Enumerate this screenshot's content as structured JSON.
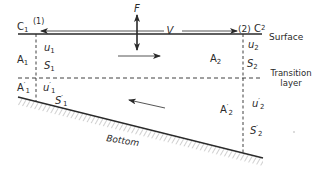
{
  "diagram": {
    "colors": {
      "ink": "#2a2a2a",
      "hatch": "#8a8a8a",
      "background": "#ffffff"
    },
    "surface": {
      "label": "Surface",
      "left_label": "C",
      "left_sub": "1",
      "right_label": "C",
      "right_sub": "2"
    },
    "transition": {
      "label_line1": "Transition",
      "label_line2": "layer"
    },
    "bottom": {
      "label": "Bottom"
    },
    "sections": {
      "left": {
        "label": "(1)"
      },
      "right": {
        "label": "(2)"
      }
    },
    "force": {
      "label": "F"
    },
    "velocity": {
      "label": "V"
    },
    "upper_layer": {
      "left": {
        "area": "A",
        "area_sub": "1",
        "u": "u",
        "u_sub": "1",
        "s": "S",
        "s_sub": "1"
      },
      "right": {
        "area": "A",
        "area_sub": "2",
        "u": "u",
        "u_sub": "2",
        "s": "S",
        "s_sub": "2"
      },
      "flow_direction": "right"
    },
    "lower_layer": {
      "left": {
        "area": "A",
        "area_prime": "′",
        "area_sub": "1",
        "u": "u",
        "u_prime": "′",
        "u_sub": "1",
        "s": "S",
        "s_prime": "′",
        "s_sub": "1"
      },
      "right": {
        "area": "A",
        "area_prime": "′",
        "area_sub": "2",
        "u": "u",
        "u_prime": "′",
        "u_sub": "2",
        "s": "S",
        "s_prime": "′",
        "s_sub": "2"
      },
      "flow_direction": "left"
    }
  }
}
